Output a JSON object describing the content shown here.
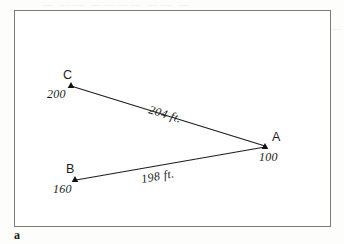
{
  "figure": {
    "caption": "a",
    "frame": {
      "border_color": "#7a7a78",
      "background": "#ffffff"
    },
    "line_color": "#1d1d1d",
    "points": [
      {
        "id": "C",
        "label": "C",
        "elevation": "200",
        "x": 71,
        "y": 85
      },
      {
        "id": "A",
        "label": "A",
        "elevation": "100",
        "x": 265,
        "y": 146
      },
      {
        "id": "B",
        "label": "B",
        "elevation": "160",
        "x": 75,
        "y": 179
      }
    ],
    "segments": [
      {
        "from": "C",
        "to": "A",
        "label": "204 ft.",
        "label_x": 148,
        "label_y": 113,
        "label_rotation": 17
      },
      {
        "from": "B",
        "to": "A",
        "label": "198 ft.",
        "label_x": 142,
        "label_y": 183,
        "label_rotation": -10
      }
    ]
  },
  "bleed_through": {
    "line1": "— —— ———— —— —",
    "line2": "————  ———",
    "line3": "——  — ———",
    "line4": "——    —",
    "line5": "——    —   ——   ——"
  }
}
